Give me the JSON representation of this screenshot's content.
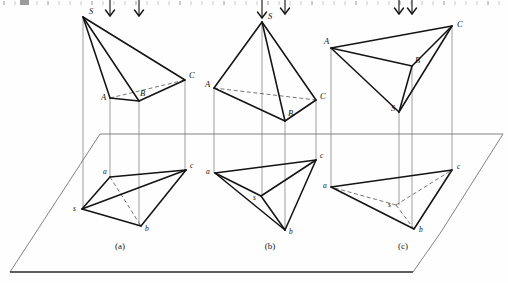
{
  "page": {
    "width": 508,
    "height": 283,
    "background": "#fefefe",
    "ink": "#141414"
  },
  "ruler": {
    "visible": true,
    "y": 3,
    "tick_spacing": 11,
    "count": 46,
    "color": "#bdbdbd"
  },
  "ground_plane": {
    "name": "horizontal-projection-plane",
    "top_left_x": 100,
    "top_y": 134,
    "top_right_x": 503,
    "bottom_left_x": 10,
    "bottom_y": 272,
    "bottom_right_x": 413,
    "right_apex_x": 441,
    "right_apex_y": 232,
    "edge_color": "#6d6d6d",
    "bottom_edge_color": "#2a2a2a"
  },
  "figures": [
    {
      "id": "a",
      "caption": "(a)",
      "caption_x": 120,
      "caption_y": 249,
      "upper": {
        "name": "pyramid-front-view-a",
        "vertices": {
          "S": {
            "x": 83,
            "y": 17,
            "label": "S",
            "lx": 89,
            "ly": 14
          },
          "A": {
            "x": 110,
            "y": 98,
            "label": "A",
            "lx": 101,
            "ly": 100
          },
          "B": {
            "x": 139,
            "y": 101,
            "label": "B",
            "lx": 140,
            "ly": 96
          },
          "C": {
            "x": 185,
            "y": 80,
            "label": "C",
            "lx": 189,
            "ly": 78
          }
        },
        "solid_edges": [
          [
            "S",
            "A"
          ],
          [
            "S",
            "B"
          ],
          [
            "S",
            "C"
          ],
          [
            "A",
            "B"
          ],
          [
            "B",
            "C"
          ]
        ],
        "hidden_edges": [
          [
            "A",
            "C"
          ]
        ]
      },
      "lower": {
        "name": "pyramid-top-view-a",
        "vertices": {
          "s": {
            "x": 82,
            "y": 209,
            "label": "s",
            "lx": 73,
            "ly": 211
          },
          "a": {
            "x": 110,
            "y": 177,
            "label": "a",
            "lx": 103,
            "ly": 174
          },
          "b": {
            "x": 141,
            "y": 226,
            "label": "b",
            "lx": 145,
            "ly": 231
          },
          "c": {
            "x": 186,
            "y": 170,
            "label": "c",
            "lx": 190,
            "ly": 168
          }
        },
        "solid_edges": [
          [
            "s",
            "a"
          ],
          [
            "s",
            "b"
          ],
          [
            "s",
            "c"
          ],
          [
            "a",
            "c"
          ],
          [
            "b",
            "c"
          ]
        ],
        "hidden_edges": [
          [
            "a",
            "b"
          ]
        ]
      },
      "projectors": [
        {
          "x": 83,
          "y1": 17,
          "y2": 209
        },
        {
          "x": 110,
          "y1": 98,
          "y2": 177
        },
        {
          "x": 139,
          "y1": 101,
          "y2": 226
        },
        {
          "x": 185,
          "y1": 80,
          "y2": 170
        }
      ],
      "arrows": [
        {
          "x": 110,
          "y": 0,
          "len": 16
        },
        {
          "x": 139,
          "y": 0,
          "len": 16
        }
      ]
    },
    {
      "id": "b",
      "caption": "(b)",
      "caption_x": 270,
      "caption_y": 249,
      "upper": {
        "name": "pyramid-front-view-b",
        "vertices": {
          "S": {
            "x": 262,
            "y": 22,
            "label": "S",
            "lx": 268,
            "ly": 19
          },
          "A": {
            "x": 214,
            "y": 88,
            "label": "A",
            "lx": 205,
            "ly": 87
          },
          "B": {
            "x": 285,
            "y": 121,
            "label": "B",
            "lx": 288,
            "ly": 116
          },
          "C": {
            "x": 316,
            "y": 100,
            "label": "C",
            "lx": 320,
            "ly": 99
          }
        },
        "solid_edges": [
          [
            "S",
            "A"
          ],
          [
            "S",
            "B"
          ],
          [
            "S",
            "C"
          ],
          [
            "A",
            "B"
          ],
          [
            "B",
            "C"
          ]
        ],
        "hidden_edges": [
          [
            "A",
            "C"
          ]
        ]
      },
      "lower": {
        "name": "pyramid-top-view-b",
        "vertices": {
          "s": {
            "x": 261,
            "y": 196,
            "label": "s",
            "lx": 253,
            "ly": 200
          },
          "a": {
            "x": 215,
            "y": 173,
            "label": "a",
            "lx": 206,
            "ly": 174
          },
          "b": {
            "x": 285,
            "y": 230,
            "label": "b",
            "lx": 289,
            "ly": 234
          },
          "c": {
            "x": 316,
            "y": 160,
            "label": "c",
            "lx": 320,
            "ly": 158
          }
        },
        "solid_edges": [
          [
            "s",
            "a"
          ],
          [
            "s",
            "b"
          ],
          [
            "s",
            "c"
          ],
          [
            "a",
            "c"
          ],
          [
            "b",
            "c"
          ],
          [
            "a",
            "b"
          ]
        ],
        "hidden_edges": []
      },
      "projectors": [
        {
          "x": 262,
          "y1": 22,
          "y2": 196
        },
        {
          "x": 214,
          "y1": 88,
          "y2": 173
        },
        {
          "x": 285,
          "y1": 121,
          "y2": 230
        },
        {
          "x": 316,
          "y1": 100,
          "y2": 160
        }
      ],
      "arrows": [
        {
          "x": 262,
          "y": 0,
          "len": 18
        },
        {
          "x": 285,
          "y": 0,
          "len": 14
        }
      ]
    },
    {
      "id": "c",
      "caption": "(c)",
      "caption_x": 403,
      "caption_y": 249,
      "upper": {
        "name": "pyramid-front-view-c",
        "vertices": {
          "S": {
            "x": 399,
            "y": 112,
            "label": "S",
            "lx": 391,
            "ly": 111
          },
          "A": {
            "x": 331,
            "y": 48,
            "label": "A",
            "lx": 324,
            "ly": 44
          },
          "B": {
            "x": 412,
            "y": 66,
            "label": "B",
            "lx": 415,
            "ly": 63
          },
          "C": {
            "x": 452,
            "y": 26,
            "label": "C",
            "lx": 457,
            "ly": 27
          }
        },
        "solid_edges": [
          [
            "A",
            "B"
          ],
          [
            "A",
            "C"
          ],
          [
            "A",
            "S"
          ],
          [
            "B",
            "C"
          ],
          [
            "B",
            "S"
          ],
          [
            "S",
            "C"
          ]
        ],
        "hidden_edges": []
      },
      "lower": {
        "name": "pyramid-top-view-c",
        "vertices": {
          "s": {
            "x": 396,
            "y": 205,
            "label": "s",
            "lx": 388,
            "ly": 207
          },
          "a": {
            "x": 331,
            "y": 187,
            "label": "a",
            "lx": 323,
            "ly": 188
          },
          "b": {
            "x": 414,
            "y": 229,
            "label": "b",
            "lx": 419,
            "ly": 232
          },
          "c": {
            "x": 452,
            "y": 170,
            "label": "c",
            "lx": 457,
            "ly": 169
          }
        },
        "solid_edges": [
          [
            "a",
            "b"
          ],
          [
            "a",
            "c"
          ],
          [
            "b",
            "c"
          ]
        ],
        "hidden_edges": [
          [
            "s",
            "a"
          ],
          [
            "s",
            "b"
          ],
          [
            "s",
            "c"
          ]
        ]
      },
      "projectors": [
        {
          "x": 399,
          "y1": 112,
          "y2": 205
        },
        {
          "x": 331,
          "y1": 48,
          "y2": 187
        },
        {
          "x": 412,
          "y1": 66,
          "y2": 229
        },
        {
          "x": 452,
          "y1": 26,
          "y2": 170
        }
      ],
      "arrows": [
        {
          "x": 399,
          "y": 0,
          "len": 14
        },
        {
          "x": 412,
          "y": 0,
          "len": 14
        }
      ]
    }
  ]
}
